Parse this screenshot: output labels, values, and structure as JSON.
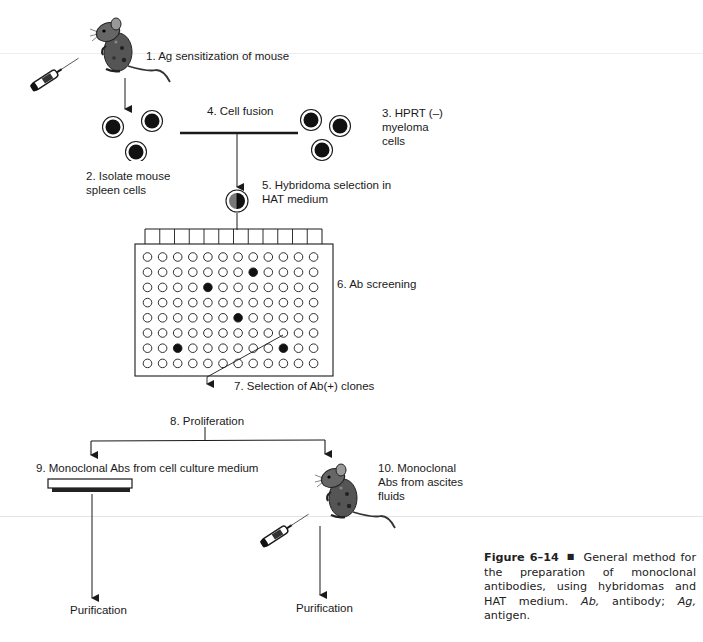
{
  "figure": {
    "page_header_fragment": "",
    "steps": [
      {
        "id": 1,
        "label": "1. Ag sensitization of mouse"
      },
      {
        "id": 2,
        "label_lines": [
          "2. Isolate mouse",
          "spleen cells"
        ]
      },
      {
        "id": 3,
        "label_lines": [
          "3. HPRT (–)",
          "myeloma",
          "cells"
        ]
      },
      {
        "id": 4,
        "label": "4. Cell fusion"
      },
      {
        "id": 5,
        "label_lines": [
          "5.  Hybridoma selection in",
          "HAT medium"
        ]
      },
      {
        "id": 6,
        "label": "6. Ab screening"
      },
      {
        "id": 7,
        "label": "7. Selection of Ab(+) clones"
      },
      {
        "id": 8,
        "label": "8. Proliferation"
      },
      {
        "id": 9,
        "label": "9. Monoclonal Abs from cell culture medium"
      },
      {
        "id": 10,
        "label_lines": [
          "10. Monoclonal",
          "Abs from ascites",
          "fluids"
        ]
      }
    ],
    "outputs": {
      "left": "Purification",
      "right": "Purification"
    },
    "well_plate": {
      "rows": 8,
      "columns": 12,
      "positive_wells": [
        {
          "row": 2,
          "col": 8
        },
        {
          "row": 3,
          "col": 5
        },
        {
          "row": 5,
          "col": 7
        },
        {
          "row": 7,
          "col": 3
        },
        {
          "row": 7,
          "col": 10
        }
      ],
      "selected_well": {
        "row": 6,
        "col": 10
      }
    },
    "caption": {
      "figure_number": "Figure 6–14",
      "separator": "■",
      "text_part1": "General method for the preparation of monoclonal antibodies, using hybridomas and HAT medium.",
      "abbr1": "Ab,",
      "def1": "antibody;",
      "abbr2": "Ag,",
      "def2": "antigen."
    },
    "colors": {
      "ink": "#1a1a1a",
      "cell_fill": "#111111",
      "hybrid_half": "#777777",
      "page_rule": "#e6e6e6"
    }
  }
}
